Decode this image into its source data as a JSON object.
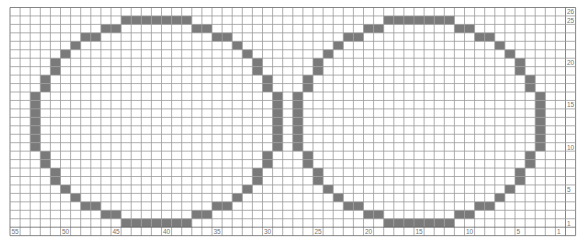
{
  "chart_data": {
    "type": "heatmap",
    "grid": {
      "columns": 55,
      "rows": 26,
      "column_numbering": "right-to-left, 1 at far right",
      "row_numbering": "bottom-to-top, 1 at bottom",
      "cell_color_filled": "#7a7a7a",
      "cell_color_empty": "#ffffff",
      "grid_line_color": "#9a9a9a"
    },
    "column_labels": [
      {
        "col_index": 0,
        "label": "55"
      },
      {
        "col_index": 5,
        "label": "50"
      },
      {
        "col_index": 10,
        "label": "45"
      },
      {
        "col_index": 15,
        "label": "40"
      },
      {
        "col_index": 20,
        "label": "35"
      },
      {
        "col_index": 25,
        "label": "30"
      },
      {
        "col_index": 30,
        "label": "25"
      },
      {
        "col_index": 35,
        "label": "20"
      },
      {
        "col_index": 40,
        "label": "15"
      },
      {
        "col_index": 45,
        "label": "10"
      },
      {
        "col_index": 50,
        "label": "5"
      },
      {
        "col_index": 54,
        "label": "1"
      }
    ],
    "row_labels": [
      {
        "row_index": 0,
        "label": "26"
      },
      {
        "row_index": 1,
        "label": "25"
      },
      {
        "row_index": 6,
        "label": "20"
      },
      {
        "row_index": 11,
        "label": "15"
      },
      {
        "row_index": 16,
        "label": "10"
      },
      {
        "row_index": 21,
        "label": "5"
      },
      {
        "row_index": 25,
        "label": "1"
      }
    ],
    "shapes": [
      {
        "name": "left-circle",
        "left_col_index": 2,
        "width_cols": 25,
        "top_row_index": 1,
        "height_rows": 25
      },
      {
        "name": "right-circle",
        "left_col_index": 28,
        "width_cols": 25,
        "top_row_index": 1,
        "height_rows": 25
      }
    ],
    "circle_outline_pattern": [
      {
        "rows": [
          1
        ],
        "offsets": [
          9,
          10,
          11,
          12,
          13,
          14,
          15
        ]
      },
      {
        "rows": [
          2
        ],
        "offsets": [
          7,
          8,
          16,
          17
        ]
      },
      {
        "rows": [
          3
        ],
        "offsets": [
          5,
          6,
          18,
          19
        ]
      },
      {
        "rows": [
          4
        ],
        "offsets": [
          4,
          20
        ]
      },
      {
        "rows": [
          5
        ],
        "offsets": [
          3,
          21
        ]
      },
      {
        "rows": [
          6,
          7
        ],
        "offsets": [
          2,
          22
        ]
      },
      {
        "rows": [
          8,
          9
        ],
        "offsets": [
          1,
          23
        ]
      },
      {
        "rows": [
          10,
          11,
          12,
          13,
          14,
          15,
          16
        ],
        "offsets": [
          0,
          24
        ]
      },
      {
        "rows": [
          17,
          18
        ],
        "offsets": [
          1,
          23
        ]
      },
      {
        "rows": [
          19,
          20
        ],
        "offsets": [
          2,
          22
        ]
      },
      {
        "rows": [
          21
        ],
        "offsets": [
          3,
          21
        ]
      },
      {
        "rows": [
          22
        ],
        "offsets": [
          4,
          20
        ]
      },
      {
        "rows": [
          23
        ],
        "offsets": [
          5,
          6,
          18,
          19
        ]
      },
      {
        "rows": [
          24
        ],
        "offsets": [
          7,
          8,
          16,
          17
        ]
      },
      {
        "rows": [
          25
        ],
        "offsets": [
          9,
          10,
          11,
          12,
          13,
          14,
          15
        ]
      }
    ]
  },
  "layout": {
    "x0": 10,
    "y0": 7.5,
    "col_w": 10.1,
    "row_h": 8.45,
    "total_cols": 56,
    "total_rows": 27
  }
}
